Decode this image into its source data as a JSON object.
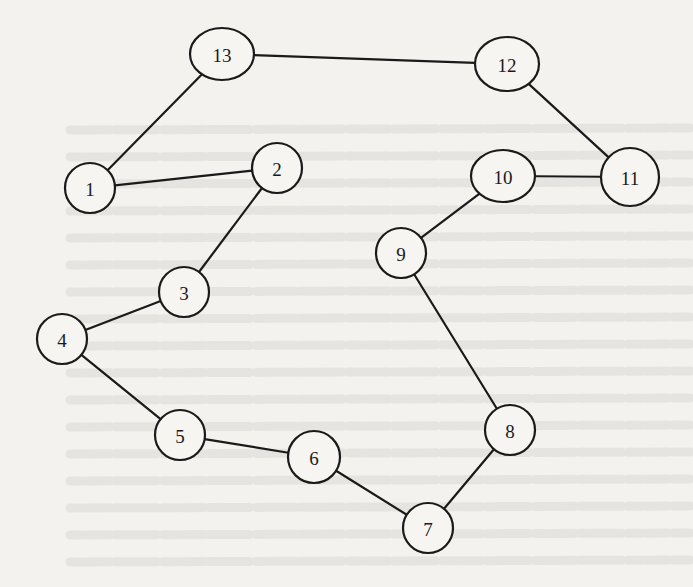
{
  "figure": {
    "type": "undirected-graph",
    "colors": {
      "background": "#f3f2ef",
      "stroke": "#1a1a1a",
      "node_fill": "#f6f5f2",
      "bleed_text": "#d9d7d2"
    },
    "nodes": [
      {
        "id": "13",
        "label": "13",
        "shape": "ellipse",
        "cx": 222,
        "cy": 54,
        "rx": 32,
        "ry": 26
      },
      {
        "id": "12",
        "label": "12",
        "shape": "ellipse",
        "cx": 507,
        "cy": 64,
        "rx": 32,
        "ry": 27
      },
      {
        "id": "1",
        "label": "1",
        "shape": "circle",
        "cx": 90,
        "cy": 188,
        "rx": 25,
        "ry": 25
      },
      {
        "id": "2",
        "label": "2",
        "shape": "circle",
        "cx": 277,
        "cy": 168,
        "rx": 25,
        "ry": 25
      },
      {
        "id": "10",
        "label": "10",
        "shape": "ellipse",
        "cx": 503,
        "cy": 176,
        "rx": 32,
        "ry": 26
      },
      {
        "id": "11",
        "label": "11",
        "shape": "circle",
        "cx": 630,
        "cy": 177,
        "rx": 29,
        "ry": 29
      },
      {
        "id": "3",
        "label": "3",
        "shape": "circle",
        "cx": 184,
        "cy": 292,
        "rx": 25,
        "ry": 25
      },
      {
        "id": "4",
        "label": "4",
        "shape": "circle",
        "cx": 62,
        "cy": 339,
        "rx": 25,
        "ry": 25
      },
      {
        "id": "9",
        "label": "9",
        "shape": "circle",
        "cx": 401,
        "cy": 253,
        "rx": 25,
        "ry": 25
      },
      {
        "id": "5",
        "label": "5",
        "shape": "circle",
        "cx": 180,
        "cy": 435,
        "rx": 25,
        "ry": 25
      },
      {
        "id": "6",
        "label": "6",
        "shape": "circle",
        "cx": 314,
        "cy": 457,
        "rx": 26,
        "ry": 26
      },
      {
        "id": "8",
        "label": "8",
        "shape": "circle",
        "cx": 510,
        "cy": 430,
        "rx": 25,
        "ry": 25
      },
      {
        "id": "7",
        "label": "7",
        "shape": "circle",
        "cx": 428,
        "cy": 528,
        "rx": 25,
        "ry": 25
      }
    ],
    "edges": [
      [
        "13",
        "12"
      ],
      [
        "13",
        "1"
      ],
      [
        "12",
        "11"
      ],
      [
        "1",
        "2"
      ],
      [
        "2",
        "3"
      ],
      [
        "11",
        "10"
      ],
      [
        "10",
        "9"
      ],
      [
        "3",
        "4"
      ],
      [
        "4",
        "5"
      ],
      [
        "9",
        "8"
      ],
      [
        "5",
        "6"
      ],
      [
        "6",
        "7"
      ],
      [
        "7",
        "8"
      ]
    ]
  }
}
